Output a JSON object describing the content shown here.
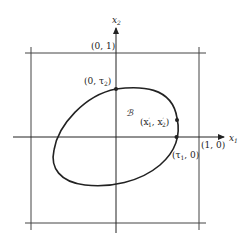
{
  "diagram": {
    "axes": {
      "x_label": "x",
      "x_sub": "1",
      "y_label": "x",
      "y_sub": "2"
    },
    "points": {
      "top_box": "(0, 1)",
      "right_box": "(1, 0)",
      "tau2_point": "(0, τ",
      "tau2_sub": "2",
      "tau1_point": "(τ",
      "tau1_sub": "1",
      "tau1_tail": ", 0)",
      "xprime_open": "(x",
      "xprime_1": "′",
      "xprime_1sub": "1",
      "xprime_sep": ", x",
      "xprime_2": "′",
      "xprime_2sub": "2",
      "xprime_close": ")"
    },
    "region_label": "ℬ"
  },
  "colors": {
    "stroke": "#222222",
    "grid": "#444444"
  }
}
